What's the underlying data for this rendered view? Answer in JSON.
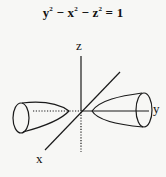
{
  "equation": {
    "y_term": "y",
    "minus1": " − ",
    "x_term": "x",
    "minus2": " − ",
    "z_term": "z",
    "exp": "2",
    "equals": " = 1"
  },
  "axes": {
    "z_label": "z",
    "y_label": "y",
    "x_label": "x"
  },
  "figure": {
    "type": "hyperboloid of two sheets",
    "stroke_color": "#1a1a1a",
    "background": "#f7f7f5"
  }
}
